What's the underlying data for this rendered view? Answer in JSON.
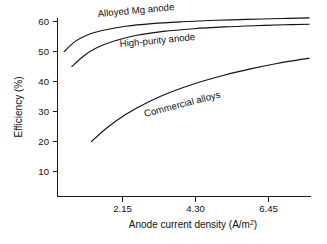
{
  "chart_data": {
    "type": "line",
    "title": "",
    "xlabel": "Anode current density (A/m²)",
    "ylabel": "Efficiency (%)",
    "xlabel_main": "Anode current density (A/m",
    "xlabel_sup": "2",
    "xlabel_tail": ")",
    "xlim": [
      1.0,
      7.7
    ],
    "ylim": [
      0,
      63
    ],
    "grid": false,
    "legend": "inline-curve-labels",
    "xticks": [
      "2.15",
      "4.30",
      "6.45"
    ],
    "xtick_values": [
      2.15,
      4.3,
      6.45
    ],
    "yticks": [
      "10",
      "20",
      "30",
      "40",
      "50",
      "60"
    ],
    "ytick_values": [
      10,
      20,
      30,
      40,
      50,
      60
    ],
    "series": [
      {
        "name": "Alloyed Mg anode",
        "label": "Alloyed Mg anode",
        "color": "#111111",
        "x": [
          1.18,
          1.45,
          1.8,
          2.15,
          2.8,
          3.5,
          4.3,
          5.2,
          6.0,
          6.9,
          7.65
        ],
        "values": [
          50.0,
          53.2,
          55.6,
          56.9,
          58.4,
          59.3,
          59.9,
          60.4,
          60.7,
          61.0,
          61.2
        ]
      },
      {
        "name": "High-purity anode",
        "label": "High-purity anode",
        "color": "#111111",
        "x": [
          1.38,
          1.7,
          2.05,
          2.5,
          3.1,
          3.8,
          4.6,
          5.4,
          6.2,
          7.0,
          7.65
        ],
        "values": [
          45.0,
          48.6,
          51.3,
          53.5,
          55.4,
          56.7,
          57.6,
          58.2,
          58.6,
          58.9,
          59.1
        ]
      },
      {
        "name": "Commercial alloys",
        "label": "Commercial alloys",
        "color": "#111111",
        "x": [
          1.9,
          2.3,
          2.8,
          3.4,
          4.0,
          4.7,
          5.4,
          6.1,
          6.8,
          7.65
        ],
        "values": [
          20.0,
          24.5,
          29.0,
          33.2,
          36.5,
          39.6,
          42.1,
          44.2,
          46.0,
          47.8
        ]
      }
    ],
    "series_label_positions": [
      {
        "x": 98,
        "y": 17,
        "rotate": -5.2
      },
      {
        "x": 120,
        "y": 47,
        "rotate": -5.2
      },
      {
        "x": 145,
        "y": 117,
        "rotate": -14.5
      }
    ]
  }
}
